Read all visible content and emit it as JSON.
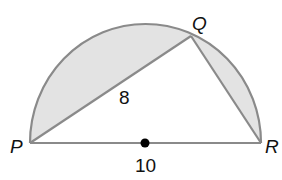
{
  "diagram": {
    "type": "semicircle-inscribed-triangle",
    "colors": {
      "stroke": "#8a8a8a",
      "shaded_fill": "#e3e3e3",
      "background": "#ffffff",
      "text": "#111111",
      "center_dot": "#000000"
    },
    "vertices": {
      "P": {
        "label": "P"
      },
      "Q": {
        "label": "Q"
      },
      "R": {
        "label": "R"
      }
    },
    "measures": {
      "PQ": "8",
      "PR": "10"
    },
    "center_marker": "center-dot"
  }
}
